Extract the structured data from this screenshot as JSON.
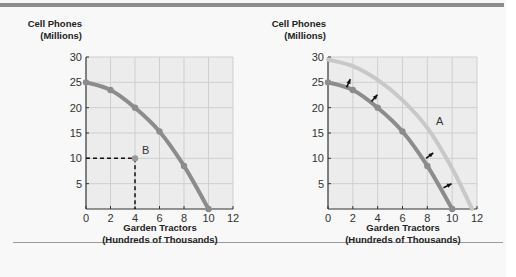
{
  "chart_data": [
    {
      "type": "line",
      "title": "",
      "ylabel_line1": "Cell Phones",
      "ylabel_line2": "(Millions)",
      "xlabel_line1": "Garden Tractors",
      "xlabel_line2": "(Hundreds of Thousands)",
      "xlim": [
        0,
        12
      ],
      "ylim": [
        0,
        30
      ],
      "xticks": [
        0,
        2,
        4,
        6,
        8,
        10,
        12
      ],
      "yticks": [
        5,
        10,
        15,
        20,
        25,
        30
      ],
      "grid": true,
      "series": [
        {
          "name": "Production possibilities frontier",
          "x": [
            0,
            2,
            4,
            6,
            8,
            10
          ],
          "y": [
            25,
            23.5,
            20,
            15.3,
            8.5,
            0
          ],
          "color": "#8c8c8c"
        }
      ],
      "annotations": [
        {
          "label": "B",
          "x": 4,
          "y": 10,
          "note": "point inside frontier with dashed guide lines"
        }
      ]
    },
    {
      "type": "line",
      "title": "",
      "ylabel_line1": "Cell Phones",
      "ylabel_line2": "(Millions)",
      "xlabel_line1": "Garden Tractors",
      "xlabel_line2": "(Hundreds of Thousands)",
      "xlim": [
        0,
        12
      ],
      "ylim": [
        0,
        30
      ],
      "xticks": [
        0,
        2,
        4,
        6,
        8,
        10,
        12
      ],
      "yticks": [
        5,
        10,
        15,
        20,
        25,
        30
      ],
      "grid": true,
      "series": [
        {
          "name": "Original frontier",
          "x": [
            0,
            2,
            4,
            6,
            8,
            10
          ],
          "y": [
            25,
            23.5,
            20,
            15.3,
            8.5,
            0
          ],
          "color": "#8c8c8c"
        },
        {
          "name": "Shifted frontier A",
          "x": [
            0,
            2,
            4,
            6,
            8,
            10,
            11.6
          ],
          "y": [
            29.5,
            28.2,
            25.5,
            21.5,
            16,
            8,
            0
          ],
          "color": "#c8c8c8"
        }
      ],
      "annotations": [
        {
          "label": "A",
          "x": 8.7,
          "y": 16.5,
          "note": "label on shifted curve"
        },
        {
          "label": "arrows",
          "note": "four black arrows pointing outward from original to shifted frontier"
        }
      ]
    }
  ]
}
